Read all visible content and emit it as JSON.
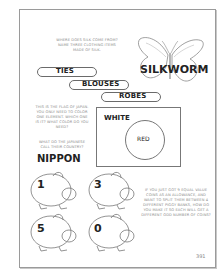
{
  "silk": {
    "question": "WHERE DOES SILK COME FROM? NAME THREE CLOTHING ITEMS MADE OF SILK.",
    "answer_source": "SILKWORM",
    "items": [
      "TIES",
      "BLOUSES",
      "ROBES"
    ]
  },
  "japan": {
    "question": "THIS IS THE FLAG OF JAPAN. YOU ONLY NEED TO COLOR ONE ELEMENT. WHICH ONE IS IT? WHAT COLOR DO YOU NEED?",
    "background_label": "WHITE",
    "circle_label": "RED",
    "name_question": "WHAT DO THE JAPANESE CALL THEIR COUNTRY?",
    "name_answer": "NIPPON"
  },
  "piggy": {
    "question": "IF YOU JUST GOT 9 EQUAL VALUE COINS AS AN ALLOWANCE, AND WANT TO SPLIT THEM BETWEEN 4 DIFFERENT PIGGY BANKS, HOW DO YOU MAKE IT SO EACH WILL GET A DIFFERENT ODD NUMBER OF COINS?",
    "banks": [
      "1",
      "3",
      "5",
      "0"
    ]
  },
  "page_number": "391"
}
